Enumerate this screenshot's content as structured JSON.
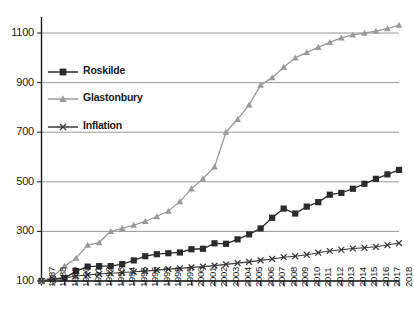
{
  "chart_data": {
    "type": "line",
    "title": "",
    "subtitle": "",
    "xlabel": "",
    "ylabel": "",
    "grid": true,
    "legend_position": "upper-left-inside",
    "ylim": [
      100,
      1160
    ],
    "yticks": [
      100,
      300,
      500,
      700,
      900,
      1100
    ],
    "ytick_labels": [
      "100",
      "300",
      "500",
      "700",
      "900",
      "1100"
    ],
    "x": [
      1987,
      1988,
      1989,
      1990,
      1991,
      1992,
      1993,
      1994,
      1995,
      1996,
      1997,
      1998,
      1999,
      2000,
      2001,
      2002,
      2003,
      2004,
      2005,
      2006,
      2007,
      2008,
      2009,
      2010,
      2011,
      2012,
      2013,
      2014,
      2015,
      2016,
      2017,
      2018
    ],
    "xtick_labels": [
      "1987",
      "1988",
      "1989",
      "1990",
      "1991",
      "1992",
      "1993",
      "1994",
      "1995",
      "1996",
      "1997",
      "1998",
      "1999",
      "2000",
      "2001",
      "2002",
      "2003",
      "2004",
      "2005",
      "2006",
      "2007",
      "2008",
      "2009",
      "2010",
      "2011",
      "2012",
      "2013",
      "2014",
      "2015",
      "2016",
      "2017",
      "2018"
    ],
    "series": [
      {
        "name": "Roskilde",
        "color": "#2b2b2b",
        "marker": "square",
        "values": [
          100,
          108,
          112,
          140,
          158,
          160,
          160,
          168,
          183,
          200,
          208,
          212,
          215,
          228,
          230,
          252,
          250,
          268,
          288,
          312,
          355,
          392,
          372,
          400,
          418,
          448,
          455,
          472,
          492,
          512,
          530,
          548
        ]
      },
      {
        "name": "Glastonbury",
        "color": "#9a9a9a",
        "marker": "triangle",
        "values": [
          100,
          118,
          160,
          192,
          245,
          255,
          300,
          312,
          325,
          340,
          360,
          382,
          420,
          472,
          512,
          560,
          700,
          752,
          810,
          890,
          920,
          962,
          1000,
          1022,
          1042,
          1062,
          1080,
          1092,
          1100,
          1108,
          1118,
          1132
        ]
      },
      {
        "name": "Inflation",
        "color": "#3a3a3a",
        "marker": "cross",
        "values": [
          100,
          105,
          112,
          120,
          124,
          128,
          131,
          134,
          137,
          140,
          144,
          148,
          151,
          155,
          158,
          162,
          167,
          172,
          177,
          183,
          189,
          196,
          200,
          206,
          214,
          221,
          226,
          231,
          234,
          238,
          245,
          253
        ]
      }
    ]
  },
  "legend": {
    "items": [
      {
        "label": "Roskilde"
      },
      {
        "label": "Glastonbury"
      },
      {
        "label": "Inflation"
      }
    ]
  }
}
